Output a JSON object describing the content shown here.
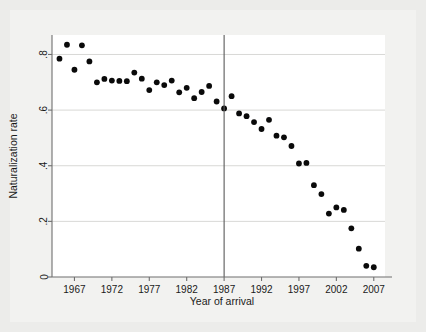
{
  "figure": {
    "background_color": "#ececea",
    "plot_background_color": "#ffffff",
    "marker_color": "#0a0a0a",
    "gridline_color": "#d8d8d6",
    "axis_color": "#6f6f6f",
    "reference_line_color": "#5a5a5a"
  },
  "chart_data": {
    "type": "scatter",
    "title": "",
    "xlabel": "Year of arrival",
    "ylabel": "Naturalization rate",
    "xlim": [
      1964,
      2008.5
    ],
    "ylim": [
      0,
      0.87
    ],
    "grid": true,
    "legend": null,
    "xticks": [
      1967,
      1972,
      1977,
      1982,
      1987,
      1992,
      1997,
      2002,
      2007
    ],
    "xtick_labels": [
      "1967",
      "1972",
      "1977",
      "1982",
      "1987",
      "1992",
      "1997",
      "2002",
      "2007"
    ],
    "yticks": [
      0,
      0.2,
      0.4,
      0.6,
      0.8
    ],
    "ytick_labels": [
      "0",
      ".2",
      ".4",
      ".6",
      ".8"
    ],
    "annotations": [
      {
        "type": "vertical-line",
        "x": 1987,
        "label": ""
      }
    ],
    "x": [
      1965,
      1966,
      1967,
      1968,
      1969,
      1970,
      1971,
      1972,
      1973,
      1974,
      1975,
      1976,
      1977,
      1978,
      1979,
      1980,
      1981,
      1982,
      1983,
      1984,
      1985,
      1986,
      1987,
      1988,
      1989,
      1990,
      1991,
      1992,
      1993,
      1994,
      1995,
      1996,
      1997,
      1998,
      1999,
      2000,
      2001,
      2002,
      2003,
      2004,
      2005,
      2006,
      2007
    ],
    "y": [
      0.785,
      0.835,
      0.745,
      0.833,
      0.775,
      0.7,
      0.712,
      0.706,
      0.705,
      0.704,
      0.735,
      0.713,
      0.672,
      0.7,
      0.69,
      0.706,
      0.664,
      0.68,
      0.643,
      0.665,
      0.687,
      0.631,
      0.606,
      0.65,
      0.588,
      0.578,
      0.557,
      0.532,
      0.565,
      0.508,
      0.502,
      0.471,
      0.408,
      0.41,
      0.33,
      0.298,
      0.228,
      0.25,
      0.241,
      0.175,
      0.102,
      0.04,
      0.035
    ],
    "series_name": "Naturalization rate by year of arrival"
  }
}
